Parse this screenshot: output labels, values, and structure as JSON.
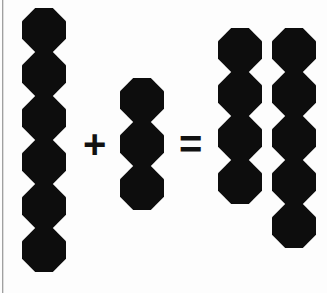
{
  "scene": {
    "title": "octagon addition equation",
    "background_color": "#fdfdfd",
    "shape_color": "#0d0d0d",
    "shape_name": "octagon",
    "width": 327,
    "height": 293
  },
  "equation": {
    "operator_plus": "+",
    "operator_equals": "=",
    "left_addend_count": 6,
    "right_addend_count": 3,
    "sum_count": 9,
    "expression": "6 + 3 = 9"
  },
  "groups": [
    {
      "role": "left-addend",
      "count": 6,
      "left": 22,
      "top": 8,
      "columns": [
        {
          "count": 6,
          "gap": 0
        }
      ]
    },
    {
      "role": "right-addend",
      "count": 3,
      "left": 120,
      "top": 78,
      "columns": [
        {
          "count": 3,
          "gap": 0
        }
      ]
    },
    {
      "role": "sum",
      "count": 9,
      "left": 218,
      "top": 28,
      "columns": [
        {
          "count": 4,
          "gap": 0
        },
        {
          "count": 5,
          "gap": 0
        }
      ]
    }
  ],
  "operators": [
    {
      "name": "plus-operator",
      "symbol": "+",
      "left": 83,
      "top": 124
    },
    {
      "name": "equals-operator",
      "symbol": "=",
      "left": 179,
      "top": 124
    }
  ]
}
